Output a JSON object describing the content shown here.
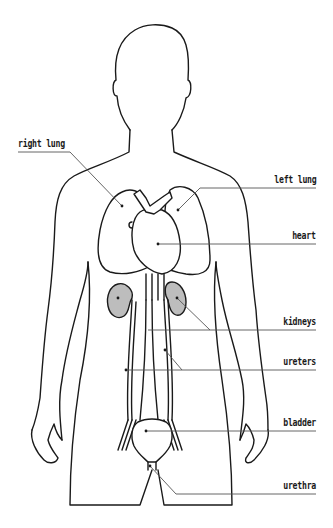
{
  "diagram": {
    "type": "anatomical-outline",
    "colors": {
      "outline": "#1a1a1a",
      "leader": "#555555",
      "kidney_fill": "#bdbdbd",
      "background": "#ffffff"
    },
    "labels": [
      {
        "id": "right-lung",
        "text": "right lung",
        "side": "left"
      },
      {
        "id": "left-lung",
        "text": "left lung",
        "side": "right"
      },
      {
        "id": "heart",
        "text": "heart",
        "side": "right"
      },
      {
        "id": "kidneys",
        "text": "kidneys",
        "side": "right"
      },
      {
        "id": "ureters",
        "text": "ureters",
        "side": "right"
      },
      {
        "id": "bladder",
        "text": "bladder",
        "side": "right"
      },
      {
        "id": "urethra",
        "text": "urethra",
        "side": "right"
      }
    ]
  }
}
